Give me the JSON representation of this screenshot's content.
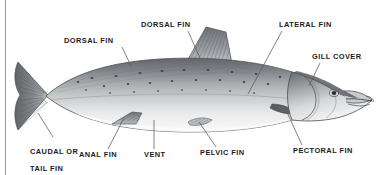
{
  "figure": {
    "kind": "anatomical-diagram",
    "background_color": "#ffffff",
    "label_color": "#1b1b1b",
    "leader_line_color": "#5a5a5a",
    "frame_line_color": "#9a9a9a",
    "fish": {
      "back_color": "#6e7176",
      "upper_body_color": "#a9adb1",
      "belly_color": "#f2f3f4",
      "fin_color": "#7d8084",
      "outline_color": "#4a4c50",
      "spot_color": "#3a3c40"
    }
  },
  "labels": [
    {
      "id": "dorsal-fin-adipose",
      "text": "DORSAL FIN",
      "lines": [
        "DORSAL FIN"
      ],
      "x": 64,
      "y": 37,
      "leader": {
        "x1": 122,
        "y1": 47,
        "x2": 131,
        "y2": 66
      }
    },
    {
      "id": "dorsal-fin-main",
      "text": "DORSAL FIN",
      "lines": [
        "DORSAL FIN"
      ],
      "x": 141,
      "y": 21,
      "leader": {
        "x1": 188,
        "y1": 31,
        "x2": 200,
        "y2": 58
      }
    },
    {
      "id": "lateral-fin",
      "text": "LATERAL FIN",
      "lines": [
        "LATERAL FIN"
      ],
      "x": 279,
      "y": 21,
      "leader": {
        "x1": 282,
        "y1": 31,
        "x2": 248,
        "y2": 94
      }
    },
    {
      "id": "gill-cover",
      "text": "GILL COVER",
      "lines": [
        "GILL COVER"
      ],
      "x": 312,
      "y": 53,
      "leader": {
        "x1": 320,
        "y1": 63,
        "x2": 309,
        "y2": 86
      }
    },
    {
      "id": "caudal-or-tail-fin",
      "text": "CAUDAL OR TAIL FIN",
      "lines": [
        "CAUDAL OR",
        "TAIL FIN"
      ],
      "x": 20,
      "y": 139,
      "leader": {
        "x1": 53,
        "y1": 137,
        "x2": 38,
        "y2": 113
      }
    },
    {
      "id": "anal-fin",
      "text": "ANAL FIN",
      "lines": [
        "ANAL FIN"
      ],
      "x": 79,
      "y": 151,
      "leader": {
        "x1": 108,
        "y1": 149,
        "x2": 124,
        "y2": 118
      }
    },
    {
      "id": "vent",
      "text": "VENT",
      "lines": [
        "VENT"
      ],
      "x": 144,
      "y": 151,
      "leader": {
        "x1": 154,
        "y1": 149,
        "x2": 154,
        "y2": 120
      }
    },
    {
      "id": "pelvic-fin",
      "text": "PELVIC FIN",
      "lines": [
        "PELVIC FIN"
      ],
      "x": 200,
      "y": 149,
      "leader": {
        "x1": 216,
        "y1": 147,
        "x2": 199,
        "y2": 122
      }
    },
    {
      "id": "pectoral-fin",
      "text": "PECTORAL FIN",
      "lines": [
        "PECTORAL FIN"
      ],
      "x": 293,
      "y": 147,
      "leader": {
        "x1": 302,
        "y1": 145,
        "x2": 286,
        "y2": 110
      }
    }
  ]
}
